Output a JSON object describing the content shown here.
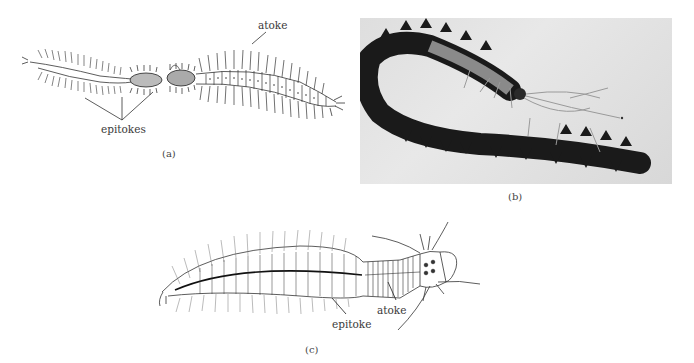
{
  "figure": {
    "panel_a": {
      "caption": "(a)",
      "labels": {
        "atoke": "atoke",
        "epitokes": "epitokes"
      }
    },
    "panel_b": {
      "caption": "(b)",
      "description": "photograph of a worm with dark epitoke segments"
    },
    "panel_c": {
      "caption": "(c)",
      "labels": {
        "epitoke": "epitoke",
        "atoke": "atoke"
      }
    }
  }
}
